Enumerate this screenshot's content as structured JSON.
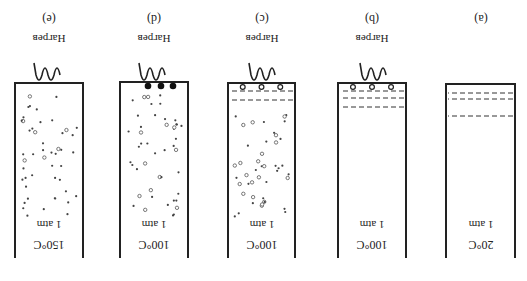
{
  "figure": {
    "orientation": "rotated 180 degrees",
    "panels": [
      {
        "id": "a",
        "panel_label": "(a)",
        "heater_label": "",
        "has_heater": false,
        "pressure_label": "1 atm",
        "temperature_label": "20°C",
        "dashed_lines": 3,
        "bottom_bubbles": 0,
        "large_dark_bubbles": 0,
        "particles": "none"
      },
      {
        "id": "b",
        "panel_label": "(b)",
        "heater_label": "Нагрев",
        "has_heater": true,
        "pressure_label": "1 atm",
        "temperature_label": "100°C",
        "dashed_lines": 3,
        "bottom_bubbles": 3,
        "large_dark_bubbles": 0,
        "particles": "none"
      },
      {
        "id": "c",
        "panel_label": "(c)",
        "heater_label": "Нагрев",
        "has_heater": true,
        "pressure_label": "1 atm",
        "temperature_label": "100°C",
        "dashed_lines": 2,
        "bottom_bubbles": 3,
        "large_dark_bubbles": 0,
        "particles": "dots and open circles"
      },
      {
        "id": "d",
        "panel_label": "(d)",
        "heater_label": "Нагрев",
        "has_heater": true,
        "pressure_label": "1 atm",
        "temperature_label": "100°C",
        "dashed_lines": 0,
        "bottom_bubbles": 0,
        "large_dark_bubbles": 3,
        "particles": "dots and open circles"
      },
      {
        "id": "e",
        "panel_label": "(e)",
        "heater_label": "Нагрев",
        "has_heater": true,
        "pressure_label": "1 atm",
        "temperature_label": "150°C",
        "dashed_lines": 0,
        "bottom_bubbles": 0,
        "large_dark_bubbles": 0,
        "particles": "dots"
      }
    ]
  }
}
